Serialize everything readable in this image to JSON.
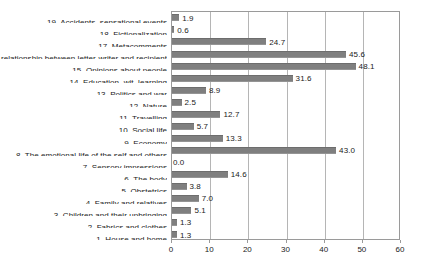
{
  "chart_data": {
    "type": "bar",
    "orientation": "horizontal",
    "title": "",
    "xlabel": "",
    "ylabel": "",
    "xlim": [
      0,
      60
    ],
    "xticks": [
      0,
      10,
      20,
      30,
      40,
      50,
      60
    ],
    "grid": true,
    "legend": false,
    "bar_color": "#7f7f7f",
    "frame_color": "#9a9a9a",
    "gridline_color": "#b5b5b5",
    "background_color": "#ffffff",
    "categories": [
      "1. House and home",
      "2. Fabrics and clothes",
      "3. Children and their upbringing",
      "4. Family and relatives",
      "5. Obstetrics",
      "6. The body",
      "7. Sensory impressions",
      "8. The emotional life of the self and others",
      "9. Economy",
      "10. Social life",
      "11. Travelling",
      "12. Nature",
      "13. Politics and war",
      "14. Education, wit, learning",
      "15. Opinions about people",
      "16. The relationship between letter-writer and recipient",
      "17. Metacomments",
      "18. Fictionalization",
      "19. Accidents, sensational events"
    ],
    "values": [
      1.3,
      1.3,
      5.1,
      7.0,
      3.8,
      14.6,
      0.0,
      43.0,
      13.3,
      5.7,
      12.7,
      2.5,
      8.9,
      31.6,
      48.1,
      45.6,
      24.7,
      0.6,
      1.9
    ],
    "value_labels": [
      "1.3",
      "1.3",
      "5.1",
      "7.0",
      "3.8",
      "14.6",
      "0.0",
      "43.0",
      "13.3",
      "5.7",
      "12.7",
      "2.5",
      "8.9",
      "31.6",
      "48.1",
      "45.6",
      "24.7",
      "0.6",
      "1.9"
    ],
    "display_order": "top-to-bottom-descending-index",
    "rows_top_to_bottom": [
      {
        "index": 19,
        "label": "19. Accidents, sensational events",
        "value": 1.9,
        "value_label": "1.9"
      },
      {
        "index": 18,
        "label": "18. Fictionalization",
        "value": 0.6,
        "value_label": "0.6"
      },
      {
        "index": 17,
        "label": "17. Metacomments",
        "value": 24.7,
        "value_label": "24.7"
      },
      {
        "index": 16,
        "label": "he relationship between letter-writer and recipient",
        "value": 45.6,
        "value_label": "45.6",
        "clipped": true
      },
      {
        "index": 15,
        "label": "15. Opinions about people",
        "value": 48.1,
        "value_label": "48.1"
      },
      {
        "index": 14,
        "label": "14. Education, wit, learning",
        "value": 31.6,
        "value_label": "31.6"
      },
      {
        "index": 13,
        "label": "13. Politics and war",
        "value": 8.9,
        "value_label": "8.9"
      },
      {
        "index": 12,
        "label": "12. Nature",
        "value": 2.5,
        "value_label": "2.5"
      },
      {
        "index": 11,
        "label": "11. Travelling",
        "value": 12.7,
        "value_label": "12.7"
      },
      {
        "index": 10,
        "label": "10. Social life",
        "value": 5.7,
        "value_label": "5.7"
      },
      {
        "index": 9,
        "label": "9. Economy",
        "value": 13.3,
        "value_label": "13.3"
      },
      {
        "index": 8,
        "label": "8. The emotional life of the self and others",
        "value": 43.0,
        "value_label": "43.0"
      },
      {
        "index": 7,
        "label": "7. Sensory impressions",
        "value": 0.0,
        "value_label": "0.0"
      },
      {
        "index": 6,
        "label": "6. The body",
        "value": 14.6,
        "value_label": "14.6"
      },
      {
        "index": 5,
        "label": "5. Obstetrics",
        "value": 3.8,
        "value_label": "3.8"
      },
      {
        "index": 4,
        "label": "4. Family and relatives",
        "value": 7.0,
        "value_label": "7.0"
      },
      {
        "index": 3,
        "label": "3. Children and their upbringing",
        "value": 5.1,
        "value_label": "5.1"
      },
      {
        "index": 2,
        "label": "2. Fabrics and clothes",
        "value": 1.3,
        "value_label": "1.3"
      },
      {
        "index": 1,
        "label": "1. House and home",
        "value": 1.3,
        "value_label": "1.3"
      }
    ]
  }
}
